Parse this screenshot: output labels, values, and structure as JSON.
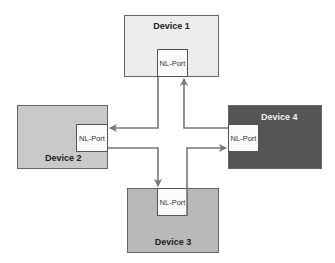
{
  "diagram": {
    "devices": [
      {
        "id": "device-1",
        "label": "Device 1",
        "port": "NL-Port",
        "fill": "#ececec"
      },
      {
        "id": "device-2",
        "label": "Device 2",
        "port": "NL-Port",
        "fill": "#c9c9c9"
      },
      {
        "id": "device-3",
        "label": "Device 3",
        "port": "NL-Port",
        "fill": "#b9b9b9"
      },
      {
        "id": "device-4",
        "label": "Device 4",
        "port": "NL-Port",
        "fill": "#555555"
      }
    ],
    "links": [
      {
        "from": "Device 1",
        "to": "Device 2"
      },
      {
        "from": "Device 2",
        "to": "Device 3"
      },
      {
        "from": "Device 3",
        "to": "Device 4"
      },
      {
        "from": "Device 4",
        "to": "Device 1"
      }
    ],
    "colors": {
      "line": "#777777",
      "border": "#555555"
    }
  }
}
